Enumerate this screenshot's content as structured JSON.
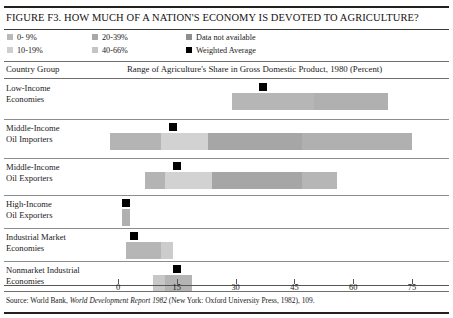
{
  "figure": {
    "title": "FIGURE F3. HOW MUCH OF A NATION'S ECONOMY IS DEVOTED TO AGRICULTURE?",
    "source": "Source:  World Bank, ",
    "source_italic": "World Development Report 1982",
    "source_tail": " (New York: Oxford University Press, 1982), 109."
  },
  "legend": {
    "items": [
      {
        "label": "0- 9%",
        "color": "#b9b9b9"
      },
      {
        "label": "10-19%",
        "color": "#cfcfcf"
      },
      {
        "label": "20-39%",
        "color": "#a8a8a8"
      },
      {
        "label": "40-66%",
        "color": "#c4c4c4"
      },
      {
        "label": "Data not available",
        "color": "#8f8f8f"
      },
      {
        "label": "Weighted Average",
        "color": "#000000"
      }
    ]
  },
  "header": {
    "left": "Country Group",
    "right": "Range of Agriculture's Share in Gross Domestic Product, 1980 (Percent)"
  },
  "chart_data": {
    "type": "bar",
    "title": "FIGURE F3. HOW MUCH OF A NATION'S ECONOMY IS DEVOTED TO AGRICULTURE?",
    "xlabel": "Range of Agriculture's Share in Gross Domestic Product, 1980 (Percent)",
    "ylabel": "Country Group",
    "xlim": [
      0,
      75
    ],
    "xticks": [
      0,
      15,
      30,
      45,
      60,
      75
    ],
    "grid": false,
    "legend_position": "top",
    "note": "Horizontal range bars; each bar spans a min-max share of GDP and is subdivided into shaded bands. Black square = weighted average.",
    "categories": [
      "Low-Income Economies",
      "Middle-Income Oil Importers",
      "Middle-Income Oil Exporters",
      "High-Income Oil Exporters",
      "Industrial Market Economies",
      "Nonmarket Industrial Economies"
    ],
    "series": [
      {
        "name": "Range start",
        "values": [
          29,
          -2,
          7,
          1,
          3,
          9
        ]
      },
      {
        "name": "Range end",
        "values": [
          69,
          75,
          56,
          3,
          14,
          19
        ]
      },
      {
        "name": "Weighted Average",
        "values": [
          37,
          14,
          15,
          2,
          4,
          15
        ]
      }
    ],
    "rows": [
      {
        "label_line1": "Low-Income",
        "label_line2": "Economies",
        "range_start": 29,
        "range_end": 69,
        "weighted_average": 37,
        "segments": [
          {
            "from": 29,
            "to": 50,
            "color": "#b6b6b6"
          },
          {
            "from": 50,
            "to": 69,
            "color": "#b0b0b0"
          }
        ]
      },
      {
        "label_line1": "Middle-Income",
        "label_line2": "Oil Importers",
        "range_start": -2,
        "range_end": 75,
        "weighted_average": 14,
        "segments": [
          {
            "from": -2,
            "to": 11,
            "color": "#b4b4b4"
          },
          {
            "from": 11,
            "to": 23,
            "color": "#d2d2d2"
          },
          {
            "from": 23,
            "to": 47,
            "color": "#a6a6a6"
          },
          {
            "from": 47,
            "to": 75,
            "color": "#b0b0b0"
          }
        ]
      },
      {
        "label_line1": "Middle-Income",
        "label_line2": "Oil Exporters",
        "range_start": 7,
        "range_end": 56,
        "weighted_average": 15,
        "segments": [
          {
            "from": 7,
            "to": 12,
            "color": "#b4b4b4"
          },
          {
            "from": 12,
            "to": 24,
            "color": "#d2d2d2"
          },
          {
            "from": 24,
            "to": 47,
            "color": "#a6a6a6"
          },
          {
            "from": 47,
            "to": 56,
            "color": "#b6b6b6"
          }
        ]
      },
      {
        "label_line1": "High-Income",
        "label_line2": "Oil Exporters",
        "range_start": 1,
        "range_end": 3,
        "weighted_average": 2,
        "segments": [
          {
            "from": 1,
            "to": 3,
            "color": "#b0b0b0"
          }
        ]
      },
      {
        "label_line1": "Industrial Market",
        "label_line2": "Economies",
        "range_start": 2,
        "range_end": 14,
        "weighted_average": 4,
        "segments": [
          {
            "from": 2,
            "to": 11,
            "color": "#b6b6b6"
          },
          {
            "from": 11,
            "to": 14,
            "color": "#cccccc"
          }
        ]
      },
      {
        "label_line1": "Nonmarket Industrial",
        "label_line2": "Economies",
        "range_start": 9,
        "range_end": 19,
        "weighted_average": 15,
        "segments": [
          {
            "from": 9,
            "to": 12,
            "color": "#c7c7c7"
          },
          {
            "from": 12,
            "to": 19,
            "color": "#b4b4b4"
          }
        ]
      }
    ]
  }
}
